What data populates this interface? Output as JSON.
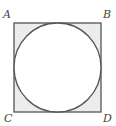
{
  "diagram": {
    "type": "square with inscribed circle",
    "labels": {
      "top_left": "A",
      "top_right": "B",
      "bottom_left": "C",
      "bottom_right": "D"
    },
    "colors": {
      "stroke": "#555555",
      "corner_shading": "#ececec",
      "circle_fill": "#ffffff"
    }
  }
}
